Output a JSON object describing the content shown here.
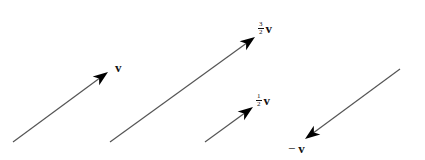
{
  "diagram": {
    "stroke_color": "#555555",
    "head_color": "#000000",
    "vectors": [
      {
        "id": "v",
        "name": "vector-v",
        "tail": [
          13,
          142
        ],
        "tip": [
          108,
          72
        ],
        "label": {
          "sign": "",
          "numerator": "",
          "denominator": "",
          "symbol": "v",
          "pos": [
            115,
            61
          ]
        }
      },
      {
        "id": "three-halves-v",
        "name": "vector-three-halves-v",
        "tail": [
          110,
          142
        ],
        "tip": [
          255,
          37
        ],
        "label": {
          "sign": "",
          "numerator": "3",
          "denominator": "2",
          "symbol": "v",
          "pos": [
            258,
            21
          ]
        }
      },
      {
        "id": "half-v",
        "name": "vector-half-v",
        "tail": [
          205,
          142
        ],
        "tip": [
          253,
          107
        ],
        "label": {
          "sign": "",
          "numerator": "1",
          "denominator": "2",
          "symbol": "v",
          "pos": [
            256,
            93
          ]
        }
      },
      {
        "id": "neg-v",
        "name": "vector-negative-v",
        "tail": [
          400,
          69
        ],
        "tip": [
          305,
          139
        ],
        "label": {
          "sign": "−",
          "numerator": "",
          "denominator": "",
          "symbol": "v",
          "pos": [
            288,
            142
          ]
        }
      }
    ]
  }
}
